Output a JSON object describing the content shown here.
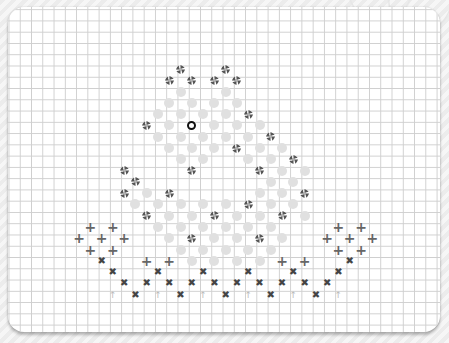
{
  "board": {
    "grid_pitch_px": 11.28,
    "origin_x": 79,
    "origin_y": 69,
    "colors": {
      "paper": "#ffffff",
      "grid_line": "#cfcfcf",
      "dot": "#e0e0e0",
      "pinwheel": "#555555",
      "ring": "#111111",
      "plus": "#666666",
      "cross": "#444444",
      "arrow": "#bbbbbb"
    },
    "legend": {
      "pinwheel": "pinwheel-icon",
      "dot": "empty-dot",
      "ring": "selected-ring",
      "plus": "plus-icon",
      "cross": "cross-icon",
      "arrow": "up-arrow-icon"
    },
    "rows": [
      {
        "r": 0,
        "items": [
          [
            "pin",
            9
          ],
          [
            "pin",
            13
          ]
        ]
      },
      {
        "r": 1,
        "items": [
          [
            "pin",
            8
          ],
          [
            "pin",
            10
          ],
          [
            "pin",
            12
          ],
          [
            "pin",
            14
          ]
        ]
      },
      {
        "r": 2,
        "items": [
          [
            "dot",
            9
          ],
          [
            "dot",
            13
          ]
        ]
      },
      {
        "r": 3,
        "items": [
          [
            "dot",
            8
          ],
          [
            "dot",
            10
          ],
          [
            "dot",
            12
          ],
          [
            "dot",
            14
          ]
        ]
      },
      {
        "r": 4,
        "items": [
          [
            "dot",
            7
          ],
          [
            "dot",
            9
          ],
          [
            "dot",
            11
          ],
          [
            "dot",
            13
          ],
          [
            "pin",
            15
          ]
        ]
      },
      {
        "r": 5,
        "items": [
          [
            "pin",
            6
          ],
          [
            "dot",
            8
          ],
          [
            "ring",
            10
          ],
          [
            "dot",
            12
          ],
          [
            "dot",
            14
          ],
          [
            "dot",
            16
          ]
        ]
      },
      {
        "r": 6,
        "items": [
          [
            "dot",
            7
          ],
          [
            "dot",
            9
          ],
          [
            "dot",
            11
          ],
          [
            "dot",
            13
          ],
          [
            "dot",
            15
          ],
          [
            "pin",
            17
          ]
        ]
      },
      {
        "r": 7,
        "items": [
          [
            "dot",
            8
          ],
          [
            "dot",
            10
          ],
          [
            "dot",
            12
          ],
          [
            "pin",
            14
          ],
          [
            "dot",
            16
          ],
          [
            "dot",
            18
          ]
        ]
      },
      {
        "r": 8,
        "items": [
          [
            "dot",
            9
          ],
          [
            "dot",
            11
          ],
          [
            "dot",
            15
          ],
          [
            "dot",
            17
          ],
          [
            "pin",
            19
          ]
        ]
      },
      {
        "r": 9,
        "items": [
          [
            "pin",
            4
          ],
          [
            "pin",
            10
          ],
          [
            "pin",
            16
          ],
          [
            "dot",
            18
          ],
          [
            "dot",
            20
          ]
        ]
      },
      {
        "r": 10,
        "items": [
          [
            "pin",
            5
          ],
          [
            "dot",
            17
          ],
          [
            "dot",
            19
          ]
        ]
      },
      {
        "r": 11,
        "items": [
          [
            "pin",
            4
          ],
          [
            "dot",
            6
          ],
          [
            "pin",
            8
          ],
          [
            "dot",
            16
          ],
          [
            "dot",
            18
          ],
          [
            "pin",
            20
          ]
        ]
      },
      {
        "r": 12,
        "items": [
          [
            "dot",
            5
          ],
          [
            "dot",
            7
          ],
          [
            "dot",
            9
          ],
          [
            "dot",
            11
          ],
          [
            "dot",
            13
          ],
          [
            "pin",
            15
          ],
          [
            "dot",
            17
          ],
          [
            "dot",
            19
          ]
        ]
      },
      {
        "r": 13,
        "items": [
          [
            "pin",
            6
          ],
          [
            "dot",
            8
          ],
          [
            "dot",
            10
          ],
          [
            "pin",
            12
          ],
          [
            "dot",
            14
          ],
          [
            "dot",
            16
          ],
          [
            "pin",
            18
          ],
          [
            "dot",
            20
          ]
        ]
      },
      {
        "r": 14,
        "items": [
          [
            "plus",
            1
          ],
          [
            "plus",
            3
          ],
          [
            "dot",
            7
          ],
          [
            "dot",
            9
          ],
          [
            "dot",
            11
          ],
          [
            "dot",
            13
          ],
          [
            "dot",
            15
          ],
          [
            "dot",
            17
          ],
          [
            "plus",
            23
          ],
          [
            "plus",
            25
          ]
        ]
      },
      {
        "r": 15,
        "items": [
          [
            "plus",
            0
          ],
          [
            "plus",
            2
          ],
          [
            "plus",
            4
          ],
          [
            "dot",
            8
          ],
          [
            "pin",
            10
          ],
          [
            "dot",
            12
          ],
          [
            "dot",
            14
          ],
          [
            "pin",
            16
          ],
          [
            "dot",
            18
          ],
          [
            "plus",
            22
          ],
          [
            "plus",
            24
          ],
          [
            "plus",
            26
          ]
        ]
      },
      {
        "r": 16,
        "items": [
          [
            "plus",
            1
          ],
          [
            "plus",
            3
          ],
          [
            "dot",
            9
          ],
          [
            "dot",
            11
          ],
          [
            "dot",
            13
          ],
          [
            "dot",
            15
          ],
          [
            "dot",
            17
          ],
          [
            "plus",
            23
          ],
          [
            "plus",
            25
          ]
        ]
      },
      {
        "r": 17,
        "items": [
          [
            "cross",
            2
          ],
          [
            "plus",
            6
          ],
          [
            "plus",
            8
          ],
          [
            "dot",
            10
          ],
          [
            "dot",
            12
          ],
          [
            "dot",
            14
          ],
          [
            "dot",
            16
          ],
          [
            "plus",
            18
          ],
          [
            "plus",
            20
          ],
          [
            "cross",
            24
          ]
        ]
      },
      {
        "r": 18,
        "items": [
          [
            "cross",
            3
          ],
          [
            "cross",
            7
          ],
          [
            "cross",
            11
          ],
          [
            "cross",
            15
          ],
          [
            "cross",
            19
          ],
          [
            "cross",
            23
          ]
        ]
      },
      {
        "r": 19,
        "items": [
          [
            "cross",
            4
          ],
          [
            "cross",
            6
          ],
          [
            "cross",
            8
          ],
          [
            "cross",
            10
          ],
          [
            "cross",
            12
          ],
          [
            "cross",
            14
          ],
          [
            "cross",
            16
          ],
          [
            "cross",
            18
          ],
          [
            "cross",
            20
          ],
          [
            "cross",
            22
          ]
        ]
      },
      {
        "r": 20,
        "items": [
          [
            "arrow",
            3
          ],
          [
            "cross",
            5
          ],
          [
            "arrow",
            7
          ],
          [
            "cross",
            9
          ],
          [
            "arrow",
            11
          ],
          [
            "cross",
            13
          ],
          [
            "arrow",
            15
          ],
          [
            "cross",
            17
          ],
          [
            "arrow",
            19
          ],
          [
            "cross",
            21
          ],
          [
            "arrow",
            23
          ]
        ]
      }
    ]
  }
}
